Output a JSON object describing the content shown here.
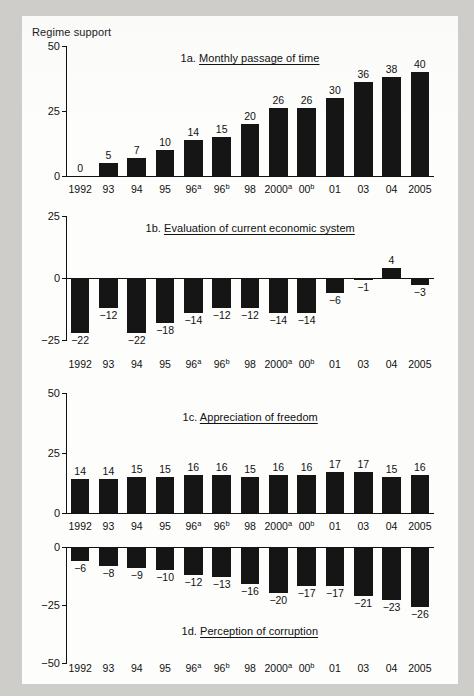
{
  "figure": {
    "axis_title": "Regime support",
    "categories": [
      "1992",
      "93",
      "94",
      "95",
      "96a",
      "96b",
      "98",
      "2000a",
      "00b",
      "01",
      "03",
      "04",
      "2005"
    ],
    "category_display": [
      {
        "base": "1992",
        "sup": ""
      },
      {
        "base": "93",
        "sup": ""
      },
      {
        "base": "94",
        "sup": ""
      },
      {
        "base": "95",
        "sup": ""
      },
      {
        "base": "96",
        "sup": "a"
      },
      {
        "base": "96",
        "sup": "b"
      },
      {
        "base": "98",
        "sup": ""
      },
      {
        "base": "2000",
        "sup": "a"
      },
      {
        "base": "00",
        "sup": "b"
      },
      {
        "base": "01",
        "sup": ""
      },
      {
        "base": "03",
        "sup": ""
      },
      {
        "base": "04",
        "sup": ""
      },
      {
        "base": "2005",
        "sup": ""
      }
    ],
    "bar_color": "#151515",
    "paper_color": "#fdfdfc",
    "page_color": "#cfcdc9"
  },
  "chart_data": [
    {
      "type": "bar",
      "id": "1a",
      "title_number": "1a.",
      "title_text": "Monthly passage of time",
      "title": "1a. Monthly passage of time",
      "xlabel": "",
      "ylabel": "Regime support",
      "ylim": [
        0,
        50
      ],
      "yticks": [
        0,
        25,
        50
      ],
      "ytick_labels": [
        "0",
        "25",
        "50"
      ],
      "grid": false,
      "legend": "none",
      "categories": [
        "1992",
        "93",
        "94",
        "95",
        "96a",
        "96b",
        "98",
        "2000a",
        "00b",
        "01",
        "03",
        "04",
        "2005"
      ],
      "values": [
        0,
        5,
        7,
        10,
        14,
        15,
        20,
        26,
        26,
        30,
        36,
        38,
        40
      ],
      "value_labels": [
        "0",
        "5",
        "7",
        "10",
        "14",
        "15",
        "20",
        "26",
        "26",
        "30",
        "36",
        "38",
        "40"
      ]
    },
    {
      "type": "bar",
      "id": "1b",
      "title_number": "1b.",
      "title_text": "Evaluation of current economic system",
      "title": "1b. Evaluation of current economic system",
      "xlabel": "",
      "ylabel": "",
      "ylim": [
        -25,
        25
      ],
      "yticks": [
        -25,
        0,
        25
      ],
      "ytick_labels": [
        "−25",
        "0",
        "25"
      ],
      "grid": false,
      "legend": "none",
      "categories": [
        "1992",
        "93",
        "94",
        "95",
        "96a",
        "96b",
        "98",
        "2000a",
        "00b",
        "01",
        "03",
        "04",
        "2005"
      ],
      "values": [
        -22,
        -12,
        -22,
        -18,
        -14,
        -12,
        -12,
        -14,
        -14,
        -6,
        -1,
        4,
        -3
      ],
      "value_labels": [
        "−22",
        "−12",
        "−22",
        "−18",
        "−14",
        "−12",
        "−12",
        "−14",
        "−14",
        "−6",
        "−1",
        "4",
        "−3"
      ]
    },
    {
      "type": "bar",
      "id": "1c",
      "title_number": "1c.",
      "title_text": "Appreciation of freedom",
      "title": "1c. Appreciation of freedom",
      "xlabel": "",
      "ylabel": "",
      "ylim": [
        0,
        50
      ],
      "yticks": [
        0,
        25,
        50
      ],
      "ytick_labels": [
        "0",
        "25",
        "50"
      ],
      "grid": false,
      "legend": "none",
      "categories": [
        "1992",
        "93",
        "94",
        "95",
        "96a",
        "96b",
        "98",
        "2000a",
        "00b",
        "01",
        "03",
        "04",
        "2005"
      ],
      "values": [
        14,
        14,
        15,
        15,
        16,
        16,
        15,
        16,
        16,
        17,
        17,
        15,
        16
      ],
      "value_labels": [
        "14",
        "14",
        "15",
        "15",
        "16",
        "16",
        "15",
        "16",
        "16",
        "17",
        "17",
        "15",
        "16"
      ]
    },
    {
      "type": "bar",
      "id": "1d",
      "title_number": "1d.",
      "title_text": "Perception of corruption",
      "title": "1d. Perception of corruption",
      "xlabel": "",
      "ylabel": "",
      "ylim": [
        -50,
        0
      ],
      "yticks": [
        -50,
        -25,
        0
      ],
      "ytick_labels": [
        "−50",
        "−25",
        "0"
      ],
      "grid": false,
      "legend": "none",
      "categories": [
        "1992",
        "93",
        "94",
        "95",
        "96a",
        "96b",
        "98",
        "2000a",
        "00b",
        "01",
        "03",
        "04",
        "2005"
      ],
      "values": [
        -6,
        -8,
        -9,
        -10,
        -12,
        -13,
        -16,
        -20,
        -17,
        -17,
        -21,
        -23,
        -26
      ],
      "value_labels": [
        "−6",
        "−8",
        "−9",
        "−10",
        "−12",
        "−13",
        "−16",
        "−20",
        "−17",
        "−17",
        "−21",
        "−23",
        "−26"
      ]
    }
  ]
}
